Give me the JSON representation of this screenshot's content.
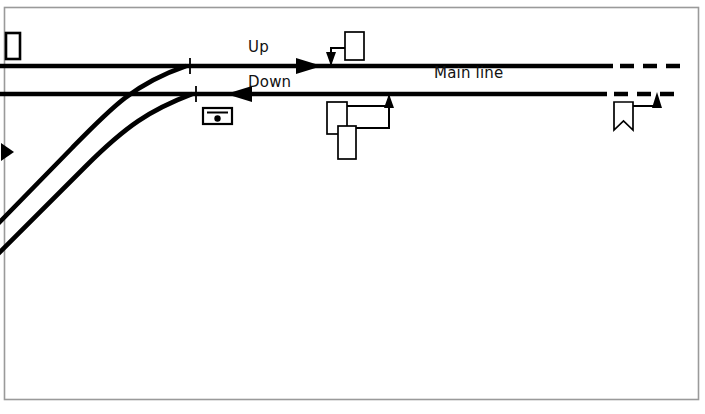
{
  "diagram": {
    "background_color": "#ffffff",
    "line_color": "#000000",
    "border_color": "#9a9a9a",
    "labels": {
      "up": "Up",
      "down": "Down",
      "main_line": "Main line"
    },
    "tracks": [
      {
        "name": "up-main-line",
        "label": "Up",
        "direction": "right",
        "y": 66,
        "x_start": 0,
        "x_solid_end": 612,
        "dashed_from": 620,
        "dashed_to": 678
      },
      {
        "name": "down-main-line",
        "label": "Down",
        "direction": "left",
        "y": 94,
        "x_start": 0,
        "x_solid_end": 606,
        "dashed_from": 614,
        "dashed_to": 676
      },
      {
        "name": "upper-converging-branch",
        "direction": "curve",
        "joins": "up-main-line",
        "from_x": 0,
        "from_y": 220
      },
      {
        "name": "lower-converging-branch",
        "direction": "curve",
        "joins": "down-main-line",
        "from_x": 0,
        "from_y": 250
      }
    ],
    "direction_arrows": [
      {
        "name": "up-direction-arrow",
        "points": "right",
        "x": 318,
        "y": 66
      },
      {
        "name": "down-direction-arrow",
        "points": "left",
        "x": 228,
        "y": 94
      },
      {
        "name": "branch-direction-arrow",
        "points": "right",
        "x": 10,
        "y": 152
      }
    ],
    "clearance_marks": [
      {
        "name": "clearance-mark-up",
        "x": 190,
        "y": 66
      },
      {
        "name": "clearance-mark-down",
        "x": 196,
        "y": 94
      }
    ],
    "signals": [
      {
        "name": "up-home-signal",
        "type": "stop-signal",
        "applies_to": "up-main-line",
        "arm_shape": "square-end",
        "side": "above",
        "post_x": 331,
        "arm_x": 345,
        "arm_y": 32,
        "arm_w": 19,
        "arm_h": 28
      },
      {
        "name": "down-home-signal-upper-arm",
        "type": "stop-signal",
        "applies_to": "down-main-line",
        "arm_shape": "square-end",
        "side": "below",
        "post_x": 389,
        "arm_x": 327,
        "arm_y": 102,
        "arm_w": 20,
        "arm_h": 32
      },
      {
        "name": "down-home-signal-lower-arm",
        "type": "stop-signal",
        "applies_to": "down-main-line",
        "arm_shape": "square-end",
        "side": "below",
        "arm_x": 338,
        "arm_y": 126,
        "arm_w": 18,
        "arm_h": 33
      },
      {
        "name": "down-distant-signal",
        "type": "distant-signal",
        "applies_to": "down-main-line",
        "arm_shape": "fishtail",
        "side": "below",
        "post_x": 657,
        "arm_x": 614,
        "arm_y": 102,
        "arm_w": 19,
        "arm_h": 28
      },
      {
        "name": "up-outer-signal",
        "type": "stop-signal",
        "arm_shape": "square-end",
        "side": "above",
        "arm_x": 6,
        "arm_y": 33,
        "arm_w": 14,
        "arm_h": 26
      }
    ],
    "ground_signal": {
      "name": "ground-disc-signal",
      "x": 203,
      "y": 108,
      "width": 29,
      "height": 16
    }
  }
}
